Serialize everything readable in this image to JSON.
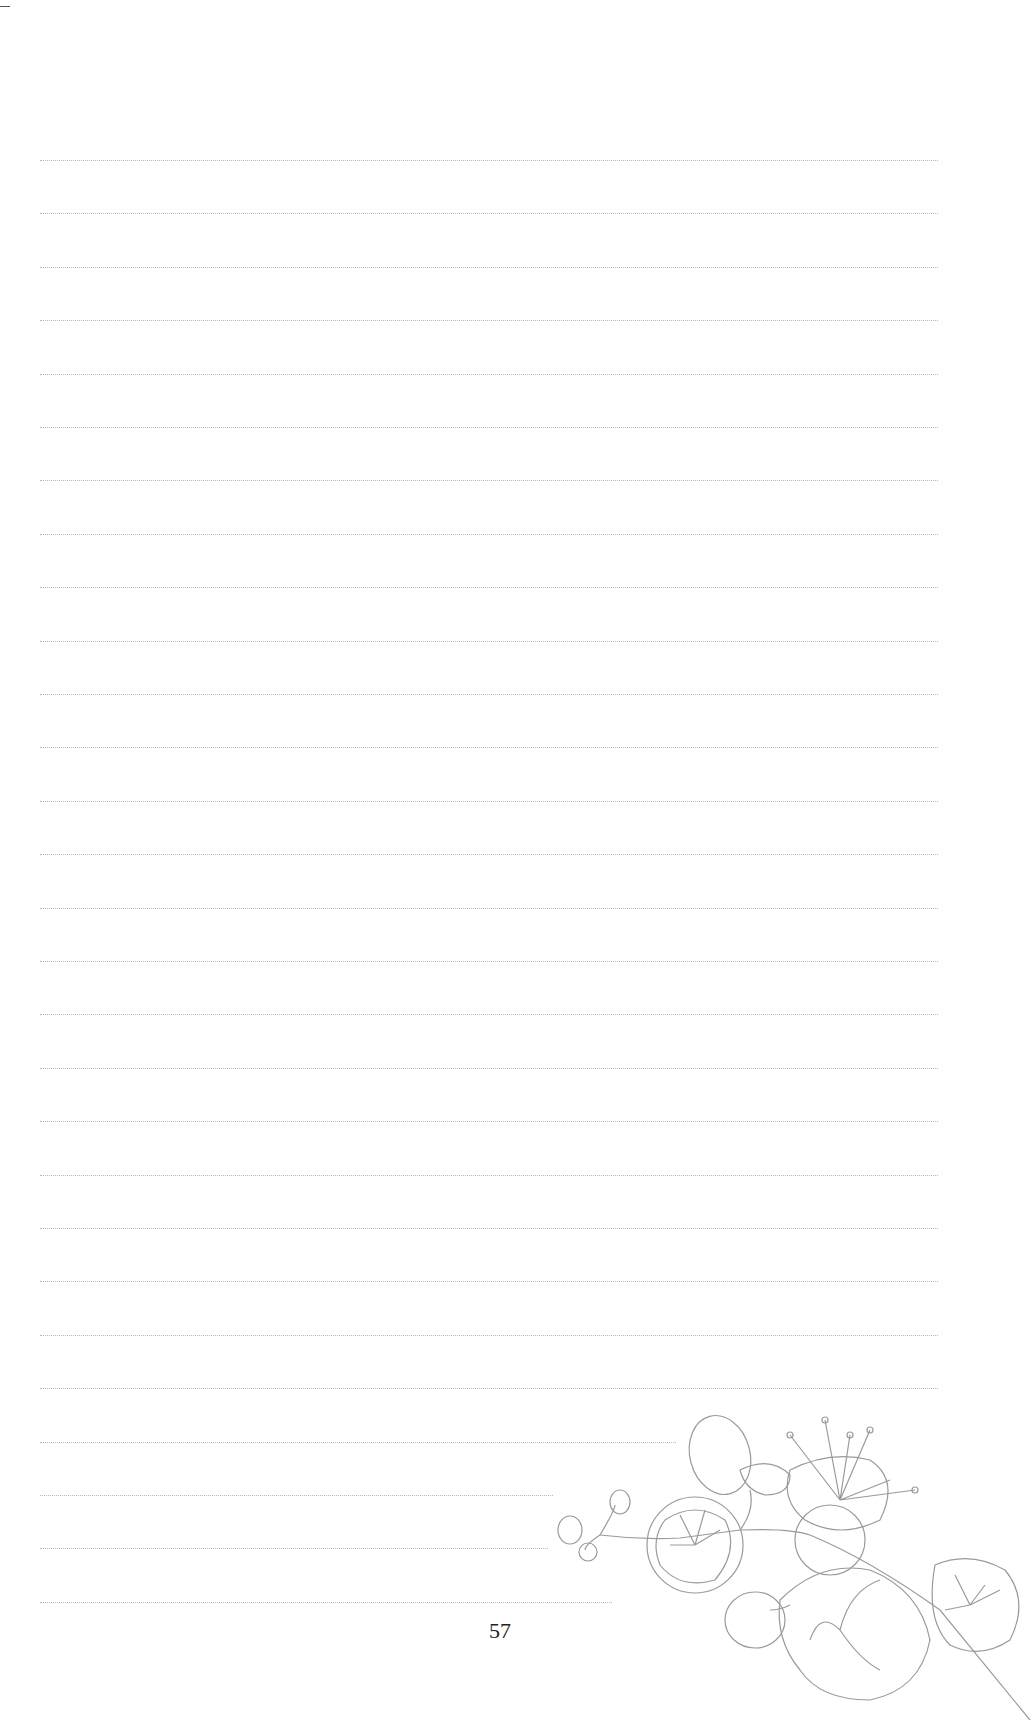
{
  "page": {
    "page_number": "57",
    "ruled_lines": {
      "count": 28,
      "first_y": 160,
      "spacing": 53.4,
      "left": 40,
      "full_right": 938,
      "short_line_rights": {
        "24": 676,
        "25": 553,
        "26": 548,
        "27": 612
      },
      "color": "#b8b8b8"
    },
    "illustration": "cherry-blossom-branch"
  }
}
